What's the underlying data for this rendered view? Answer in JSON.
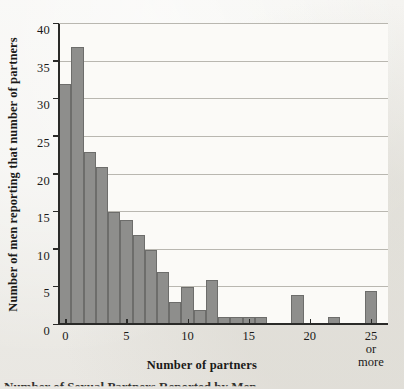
{
  "figure": {
    "background_color": "#efeeea",
    "plot_background_color": "#fbfaf7",
    "bar_fill_color": "#8e8e8c",
    "bar_edge_color": "#6d6d6b",
    "axis_color": "#2a2a28",
    "gridline_color": "#b9b7b0",
    "caption_fragment": "Number of Sexual Partners Reported by Men"
  },
  "chart_data": {
    "type": "bar",
    "title": "",
    "subtitle": "",
    "xlabel": "Number of partners",
    "ylabel": "Number of men reporting that number of partners",
    "xlim": [
      -0.6,
      26.4
    ],
    "ylim": [
      0,
      40
    ],
    "grid": true,
    "legend": null,
    "legend_position": "none",
    "bar_width": 1,
    "x_tick_values": [
      0,
      5,
      10,
      15,
      20,
      25
    ],
    "x_tick_labels": [
      "0",
      "5",
      "10",
      "15",
      "20",
      "25 or\nmore"
    ],
    "y_tick_values": [
      0,
      5,
      10,
      15,
      20,
      25,
      30,
      35,
      40
    ],
    "y_tick_labels": [
      "0",
      "5",
      "10",
      "15",
      "20",
      "25",
      "30",
      "35",
      "40"
    ],
    "categories": [
      0,
      1,
      2,
      3,
      4,
      5,
      6,
      7,
      8,
      9,
      10,
      11,
      12,
      13,
      14,
      15,
      16,
      17,
      18,
      19,
      20,
      21,
      22,
      23,
      24,
      25
    ],
    "values": [
      32,
      37,
      23,
      21,
      15,
      14,
      12,
      10,
      7,
      3,
      5,
      2,
      6,
      1,
      1,
      1,
      1,
      0,
      0,
      4,
      0,
      0,
      1,
      0,
      0,
      4.5
    ],
    "bars": [
      {
        "x": 0,
        "value": 32
      },
      {
        "x": 1,
        "value": 37
      },
      {
        "x": 2,
        "value": 23
      },
      {
        "x": 3,
        "value": 21
      },
      {
        "x": 4,
        "value": 15
      },
      {
        "x": 5,
        "value": 14
      },
      {
        "x": 6,
        "value": 12
      },
      {
        "x": 7,
        "value": 10
      },
      {
        "x": 8,
        "value": 7
      },
      {
        "x": 9,
        "value": 3
      },
      {
        "x": 10,
        "value": 5
      },
      {
        "x": 11,
        "value": 2
      },
      {
        "x": 12,
        "value": 6
      },
      {
        "x": 13,
        "value": 1
      },
      {
        "x": 14,
        "value": 1
      },
      {
        "x": 15,
        "value": 1
      },
      {
        "x": 16,
        "value": 1
      },
      {
        "x": 17,
        "value": 0
      },
      {
        "x": 18,
        "value": 0
      },
      {
        "x": 19,
        "value": 4
      },
      {
        "x": 20,
        "value": 0
      },
      {
        "x": 21,
        "value": 0
      },
      {
        "x": 22,
        "value": 1
      },
      {
        "x": 23,
        "value": 0
      },
      {
        "x": 24,
        "value": 0
      },
      {
        "x": 25,
        "value": 4.5
      }
    ]
  }
}
